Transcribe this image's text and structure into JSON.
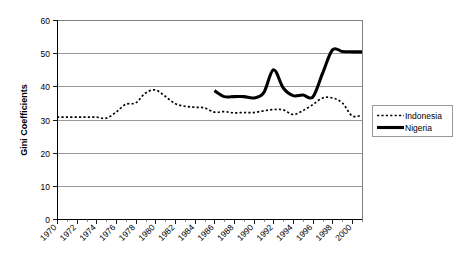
{
  "chart_data": {
    "type": "line",
    "title": "",
    "xlabel": "",
    "ylabel": "Gini Coefficients",
    "ylim": [
      0,
      60
    ],
    "xlim": [
      1970,
      2001
    ],
    "yticks": [
      0,
      10,
      20,
      30,
      40,
      50,
      60
    ],
    "ytick_labels": [
      "0",
      "10",
      "20",
      "30",
      "40",
      "50",
      "60"
    ],
    "xticks": [
      1970,
      1972,
      1974,
      1976,
      1978,
      1980,
      1982,
      1984,
      1986,
      1988,
      1990,
      1992,
      1994,
      1996,
      1998,
      2000
    ],
    "xtick_labels": [
      "1970",
      "1972",
      "1974",
      "1976",
      "1978",
      "1980",
      "1982",
      "1984",
      "1986",
      "1988",
      "1990",
      "1992",
      "1994",
      "1996",
      "1998",
      "2000"
    ],
    "grid": true,
    "grid_axis": "y",
    "legend_position": "right",
    "series": [
      {
        "name": "Indonesia",
        "style": "dashed",
        "color": "#000000",
        "x": [
          1970,
          1971,
          1972,
          1973,
          1974,
          1975,
          1976,
          1977,
          1978,
          1979,
          1980,
          1981,
          1982,
          1983,
          1984,
          1985,
          1986,
          1987,
          1988,
          1989,
          1990,
          1991,
          1992,
          1993,
          1994,
          1995,
          1996,
          1997,
          1998,
          1999,
          2000,
          2001
        ],
        "values": [
          30.7,
          30.7,
          30.7,
          30.7,
          30.7,
          30.4,
          32.2,
          34.6,
          35.0,
          38.0,
          38.9,
          37.0,
          34.8,
          34.0,
          33.7,
          33.5,
          32.2,
          32.4,
          32.0,
          32.1,
          32.1,
          32.6,
          33.0,
          32.9,
          31.5,
          32.7,
          34.5,
          36.5,
          36.5,
          35.0,
          31.1,
          31.3
        ]
      },
      {
        "name": "Nigeria",
        "style": "solid",
        "color": "#000000",
        "x": [
          1986,
          1987,
          1988,
          1989,
          1990,
          1991,
          1992,
          1993,
          1994,
          1995,
          1996,
          1997,
          1998,
          1999,
          2000,
          2001
        ],
        "values": [
          38.7,
          36.9,
          36.9,
          36.9,
          36.5,
          38.0,
          45.0,
          39.5,
          37.2,
          37.4,
          36.8,
          44.0,
          51.0,
          50.5,
          50.4,
          50.4
        ]
      }
    ]
  },
  "legend": {
    "items": [
      {
        "label": "Indonesia",
        "style": "dashed"
      },
      {
        "label": "Nigeria",
        "style": "solid"
      }
    ]
  }
}
